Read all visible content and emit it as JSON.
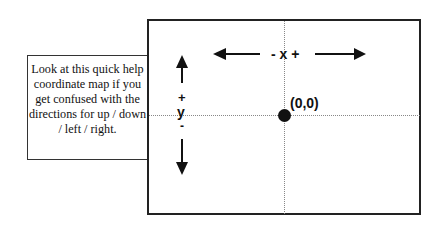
{
  "callout": {
    "text": "Look at this quick help coordinate map if you get confused with the directions for up / down / left / right."
  },
  "axes": {
    "x_label": "- x +",
    "y_plus": "+",
    "y_label": "y",
    "y_minus": "-"
  },
  "origin": {
    "label": "(0,0)"
  },
  "icons": [
    "arrow-up-icon",
    "arrow-down-icon",
    "arrow-left-icon",
    "arrow-right-icon",
    "origin-dot-icon"
  ]
}
